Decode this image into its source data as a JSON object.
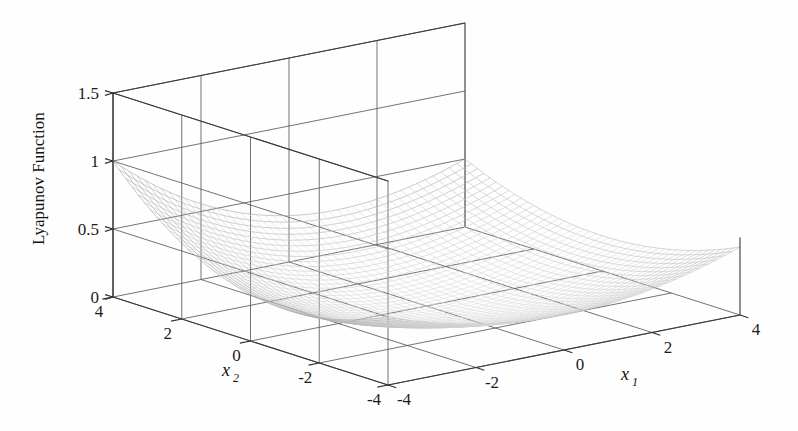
{
  "figure": {
    "background_color": "#fefefe",
    "width": 798,
    "height": 431,
    "projection": "3d-surface-wireframe"
  },
  "axes": {
    "z": {
      "title": "Lyapunov Function",
      "ticks": [
        "0",
        "0.5",
        "1",
        "1.5"
      ],
      "tick_values": [
        0,
        0.5,
        1,
        1.5
      ],
      "range": [
        0,
        1.5
      ]
    },
    "x1": {
      "title": "x",
      "subscript": "1",
      "ticks": [
        "-4",
        "-2",
        "0",
        "2",
        "4"
      ],
      "tick_values": [
        -4,
        -2,
        0,
        2,
        4
      ],
      "range": [
        -4,
        4
      ]
    },
    "x2": {
      "title": "x",
      "subscript": "2",
      "ticks": [
        "4",
        "2",
        "0",
        "-2",
        "-4"
      ],
      "tick_values": [
        4,
        2,
        0,
        -2,
        -4
      ],
      "range": [
        -4,
        4
      ]
    }
  },
  "chart_data": {
    "type": "surface",
    "title": "",
    "xlabel": "x1",
    "ylabel": "x2",
    "zlabel": "Lyapunov Function",
    "xlim": [
      -4,
      4
    ],
    "ylim": [
      -4,
      4
    ],
    "zlim": [
      0,
      1.5
    ],
    "grid": true,
    "legend": "none",
    "colormap": "grayscale-wireframe",
    "mesh_resolution": 44,
    "surface_description": "Bowl-shaped positive-definite Lyapunov function with minimum at origin, rising to approximately 1.5 at the far corner (x1 = -4, x2 = 4) and to roughly 0.5 at the near left corner",
    "function_form": "quadratic-like saddle-free bowl",
    "x_ticks": [
      -4,
      -2,
      0,
      2,
      4
    ],
    "y_ticks": [
      4,
      2,
      0,
      -2,
      -4
    ],
    "z_ticks": [
      0,
      0.5,
      1,
      1.5
    ],
    "sample_points": [
      {
        "x1": 0,
        "x2": 0,
        "z": 0.02
      },
      {
        "x1": -4,
        "x2": 4,
        "z": 1.5
      },
      {
        "x1": 4,
        "x2": 4,
        "z": 0.52
      },
      {
        "x1": -4,
        "x2": -4,
        "z": 0.48
      },
      {
        "x1": 4,
        "x2": -4,
        "z": 0.47
      },
      {
        "x1": 0,
        "x2": 4,
        "z": 0.62
      },
      {
        "x1": 0,
        "x2": -4,
        "z": 0.3
      },
      {
        "x1": -4,
        "x2": 0,
        "z": 0.6
      },
      {
        "x1": 4,
        "x2": 0,
        "z": 0.3
      }
    ]
  }
}
